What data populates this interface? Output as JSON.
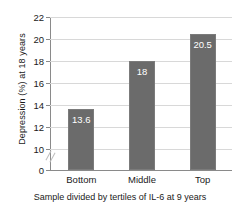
{
  "chart_data": {
    "type": "bar",
    "title": "",
    "categories": [
      "Bottom",
      "Middle",
      "Top"
    ],
    "values": [
      13.6,
      18,
      20.5
    ],
    "value_labels": [
      "13.6",
      "18",
      "20.5"
    ],
    "xlabel": "Sample divided by tertiles of IL-6 at 9 years",
    "ylabel": "Depression (%) at 18 years",
    "ylim": [
      0,
      22
    ],
    "yticks": [
      0,
      10,
      12,
      14,
      16,
      18,
      20,
      22
    ],
    "ytick_labels": [
      "0",
      "10",
      "12",
      "14",
      "16",
      "18",
      "20",
      "22"
    ],
    "axis_break": true,
    "axis_break_between": [
      0,
      10
    ],
    "grid": true,
    "grid_axis": "y",
    "legend": false,
    "bar_color": "#6b6b6b",
    "value_label_color": "#ffffff",
    "grid_color": "#d8d8d8",
    "axis_color": "#8a8a8a"
  }
}
